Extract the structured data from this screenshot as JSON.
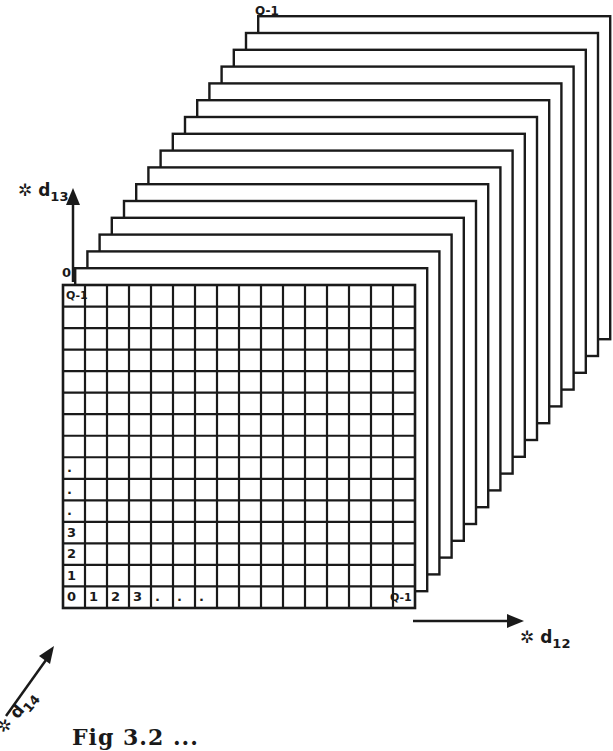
{
  "figure": {
    "caption": "Fig 3.2  ...",
    "layer_count": 16,
    "grid": {
      "columns": 16,
      "rows": 15
    },
    "labels": {
      "back_layer_top": "Q-1",
      "front_layer_index": "0",
      "front_top_left": "Q-1",
      "front_bottom_right": "Q-1",
      "row_labels": [
        "0",
        "1",
        "2",
        "3",
        ".",
        ".",
        "."
      ],
      "column_labels": [
        "0",
        "1",
        "2",
        "3",
        ".",
        ".",
        "."
      ]
    },
    "axes": {
      "vertical": {
        "symbol": "✲",
        "name": "d",
        "subscript": "13"
      },
      "horizontal": {
        "symbol": "✲",
        "name": "d",
        "subscript": "12"
      },
      "depth": {
        "symbol": "✲",
        "name": "d",
        "subscript": "14"
      }
    },
    "colors": {
      "ink": "#1a1a1a",
      "paper": "#ffffff"
    }
  }
}
